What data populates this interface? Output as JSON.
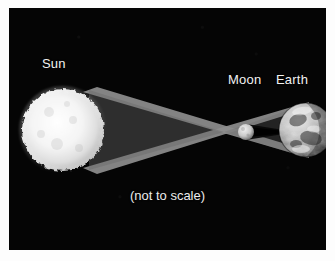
{
  "figure": {
    "caption": "(not to scale)",
    "background_color": "#050505",
    "page_color": "#ffffff",
    "label_color": "#f2f2f2"
  },
  "bodies": [
    {
      "id": "sun",
      "label": "Sun",
      "role": "light-source",
      "color": "#f0f0f0",
      "center_x": 54,
      "center_y": 122,
      "radius": 41
    },
    {
      "id": "moon",
      "label": "Moon",
      "role": "occulting-body",
      "color": "#cfcfcf",
      "center_x": 237,
      "center_y": 124,
      "radius": 8
    },
    {
      "id": "earth",
      "label": "Earth",
      "role": "observer-body",
      "color": "#b8b8b8",
      "center_x": 297,
      "center_y": 122,
      "radius": 27
    }
  ],
  "light_rays": {
    "name": "sunlight-cone",
    "color": "#8c8c8c",
    "crossing_point_x": 213,
    "crossing_point_y": 124,
    "description": "Tangent light rays from Sun limbs crossing at the Moon forming shadow cone"
  },
  "shadow": {
    "name": "umbra-cone",
    "color": "#0a0a0a",
    "apex_x": 284,
    "apex_y": 123,
    "description": "Moon umbra narrowing toward Earth surface"
  }
}
